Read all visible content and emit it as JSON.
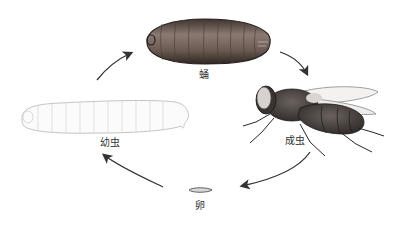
{
  "diagram": {
    "title": "",
    "stages": [
      {
        "id": "pupa",
        "label": "蛹"
      },
      {
        "id": "adult",
        "label": "成虫"
      },
      {
        "id": "egg",
        "label": "卵"
      },
      {
        "id": "larva",
        "label": "幼虫"
      }
    ],
    "arrows": [
      {
        "from": "larva",
        "to": "pupa"
      },
      {
        "from": "pupa",
        "to": "adult"
      },
      {
        "from": "adult",
        "to": "egg"
      },
      {
        "from": "egg",
        "to": "larva"
      }
    ],
    "colors": {
      "arrow": "#333333",
      "pupa": "#6e5e55",
      "adult": "#4a4440",
      "larva_outline": "#c8c8c8",
      "egg": "#777777"
    }
  }
}
